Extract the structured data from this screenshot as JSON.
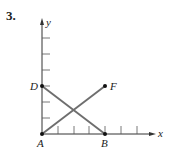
{
  "problem_number": "3.",
  "axes": {
    "x_label": "x",
    "y_label": "y",
    "x_ticks": 7,
    "y_ticks": 6
  },
  "points": [
    {
      "name": "A",
      "x": 0,
      "y": 0
    },
    {
      "name": "B",
      "x": 4,
      "y": 0
    },
    {
      "name": "D",
      "x": 0,
      "y": 3
    },
    {
      "name": "F",
      "x": 4,
      "y": 3
    }
  ],
  "segments": [
    {
      "from": "A",
      "to": "F"
    },
    {
      "from": "D",
      "to": "B"
    }
  ],
  "colors": {
    "segment": "#6e6e6e",
    "axis": "#333333",
    "point": "#111111"
  }
}
